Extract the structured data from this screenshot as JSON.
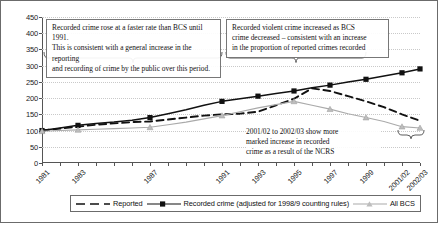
{
  "chart_data": {
    "type": "line",
    "title": "",
    "xlabel": "",
    "ylabel": "",
    "ylim": [
      0,
      450
    ],
    "ytick_step": 50,
    "grid": true,
    "legend_position": "bottom",
    "x": [
      "1981",
      "1982",
      "1983",
      "1984",
      "1985",
      "1986",
      "1987",
      "1988",
      "1989",
      "1990",
      "1991",
      "1992",
      "1993",
      "1994",
      "1995",
      "1996",
      "1997",
      "1998",
      "1999",
      "2000/01",
      "2001/02",
      "2002/03"
    ],
    "xticklabels": [
      "1981",
      "",
      "1983",
      "",
      "",
      "",
      "1987",
      "",
      "",
      "",
      "1991",
      "",
      "1993",
      "",
      "1995",
      "",
      "1997",
      "",
      "1999",
      "",
      "2001/02",
      "2002/03"
    ],
    "yticklabels": [
      "0",
      "50",
      "100",
      "150",
      "200",
      "250",
      "300",
      "350",
      "400",
      "450"
    ],
    "series": [
      {
        "name": "Reported",
        "style": "dashed",
        "color": "#111111",
        "marker": "none",
        "values": [
          100,
          106,
          112,
          118,
          122,
          126,
          128,
          134,
          140,
          146,
          150,
          152,
          158,
          178,
          198,
          230,
          222,
          206,
          190,
          172,
          150,
          130
        ]
      },
      {
        "name": "Recorded crime (adjusted for 1998/9 counting rules)",
        "style": "solid",
        "color": "#111111",
        "marker": "square",
        "marker_x": [
          "1981",
          "1983",
          "1987",
          "1991",
          "1993",
          "1995",
          "1997",
          "1999",
          "2001/02",
          "2002/03"
        ],
        "values": [
          100,
          108,
          116,
          122,
          126,
          132,
          140,
          152,
          164,
          178,
          190,
          198,
          206,
          214,
          222,
          232,
          240,
          250,
          258,
          268,
          278,
          290
        ]
      },
      {
        "name": "All BCS",
        "style": "solid-light",
        "color": "#aaaaaa",
        "marker": "triangle",
        "marker_x": [
          "1981",
          "1983",
          "1987",
          "1991",
          "1995",
          "1997",
          "1999",
          "2001/02",
          "2002/03"
        ],
        "values": [
          98,
          100,
          102,
          104,
          106,
          108,
          110,
          118,
          126,
          136,
          146,
          158,
          170,
          180,
          190,
          178,
          166,
          152,
          140,
          128,
          112,
          108
        ]
      }
    ],
    "annotations": [
      {
        "id": "annotation-recorded-vs-bcs",
        "text": "Recorded crime rose at a faster rate than BCS until 1991. This is consistent with a general increase in the reporting and recording of crime by the public over this period.",
        "bracket_from": "1981",
        "bracket_to": "1991"
      },
      {
        "id": "annotation-violent-crime",
        "text": "Recorded violent crime increased as BCS crime decreased – consistent with an increase in the proportion of reported crimes recorded",
        "bracket_from": "1991",
        "bracket_to": "1999"
      },
      {
        "id": "annotation-ncrs",
        "text": "2001/02 to 2002/03 show more marked increase in recorded crime as a result of the NCRS",
        "bracket_from": "2001/02",
        "bracket_to": "2002/03"
      }
    ]
  },
  "annotations": {
    "box1_line1": "Recorded crime rose at a faster rate than BCS until 1991.",
    "box1_line2": "This is consistent with a general increase in the reporting",
    "box1_line3": "and recording of crime by the public over this period.",
    "box2_line1": "Recorded violent crime increased as BCS",
    "box2_line2": "crime decreased – consistent with an increase",
    "box2_line3": "in the proportion of reported crimes recorded",
    "box3_line1": "2001/02 to 2002/03 show more",
    "box3_line2": "marked increase in recorded",
    "box3_line3": "crime as a result of the NCRS"
  },
  "legend": {
    "items": [
      {
        "label": "Reported",
        "icon": "dashed-line-swatch"
      },
      {
        "label": "Recorded crime (adjusted for 1998/9 counting rules)",
        "icon": "solid-line-square-marker-swatch"
      },
      {
        "label": "All BCS",
        "icon": "light-line-triangle-marker-swatch"
      }
    ]
  },
  "colors": {
    "axis": "#555555",
    "grid": "#c9c9c9",
    "reported": "#111111",
    "recorded": "#111111",
    "bcs": "#aaaaaa",
    "border": "#6b6b6b"
  }
}
